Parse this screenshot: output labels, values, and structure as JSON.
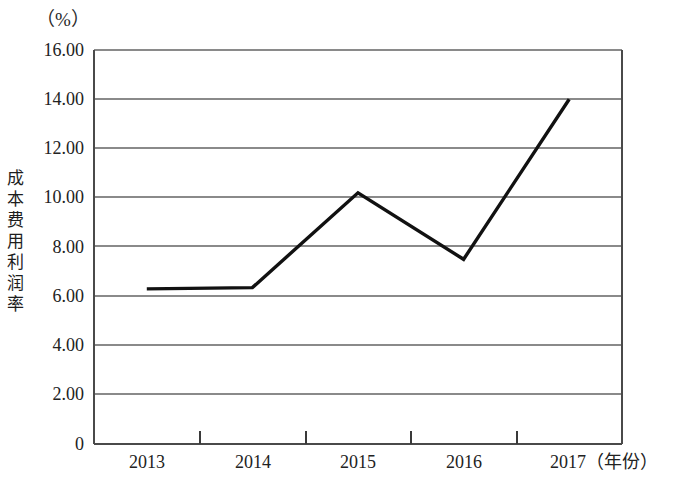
{
  "chart_data": {
    "type": "line",
    "title": "",
    "subtitle": "",
    "xlabel": "（年份）",
    "ylabel": "成本费用利润率",
    "unit_label": "（%）",
    "categories": [
      "2013",
      "2014",
      "2015",
      "2016",
      "2017"
    ],
    "x": [
      2013,
      2014,
      2015,
      2016,
      2017
    ],
    "values": [
      6.3,
      6.35,
      10.2,
      7.5,
      14.0
    ],
    "series": [
      {
        "name": "成本费用利润率",
        "values": [
          6.3,
          6.35,
          10.2,
          7.5,
          14.0
        ]
      }
    ],
    "ylim": [
      0,
      16
    ],
    "ytick_labels": [
      "16.00",
      "14.00",
      "12.00",
      "10.00",
      "8.00",
      "6.00",
      "4.00",
      "2.00",
      "0"
    ],
    "ytick_values": [
      16,
      14,
      12,
      10,
      8,
      6,
      4,
      2,
      0
    ],
    "xtick_labels": [
      "2013",
      "2014",
      "2015",
      "2016",
      "2017"
    ],
    "grid": true,
    "grid_axis": "y",
    "legend": false,
    "legend_position": "none",
    "markers": false,
    "line_color": "#111111",
    "grid_color": "#8a8a8a",
    "axis_color": "#4a4a4a",
    "background_color": "#ffffff"
  },
  "axes": {
    "y_unit": "（%）",
    "y_title": "成本费用利润率",
    "x_unit_suffix": "（年份）"
  },
  "x_axis_last_label": "2017（年份）"
}
